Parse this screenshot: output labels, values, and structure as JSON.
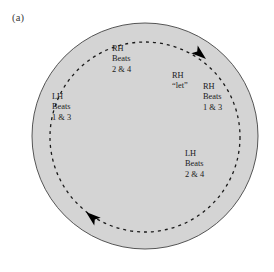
{
  "figure": {
    "panel_label": "(a)",
    "colors": {
      "disc_fill": "#d4d4d4",
      "disc_stroke": "#555555",
      "dashed_path": "#1a1a1a",
      "arrow": "#000000",
      "text": "#1a1a1a",
      "panel_label_text": "#3a3a3a",
      "background": "#ffffff"
    },
    "disc": {
      "center_x": 145,
      "center_y": 136,
      "radius": 113
    },
    "dashed_path": {
      "center_x": 145,
      "center_y": 137,
      "radius": 95,
      "direction": "clockwise",
      "dash_pattern": "3 4"
    },
    "labels": [
      {
        "id": "rh-top",
        "position": "top",
        "lines": [
          "RH",
          "Beats",
          "2 & 4"
        ]
      },
      {
        "id": "lh-left",
        "position": "left",
        "lines": [
          "LH",
          "Beats",
          "1 & 3"
        ]
      },
      {
        "id": "rh-let",
        "position": "inner-right",
        "lines": [
          "RH",
          "“let”"
        ]
      },
      {
        "id": "rh-right",
        "position": "right",
        "lines": [
          "RH",
          "Beats",
          "1 & 3"
        ]
      },
      {
        "id": "lh-bottom",
        "position": "bottom-right",
        "lines": [
          "LH",
          "Beats",
          "2 & 4"
        ]
      }
    ],
    "arrows": [
      {
        "id": "arrow-top-right",
        "angle_deg": 310,
        "points": "clockwise"
      },
      {
        "id": "arrow-bottom-left",
        "angle_deg": 130,
        "points": "clockwise"
      }
    ]
  }
}
